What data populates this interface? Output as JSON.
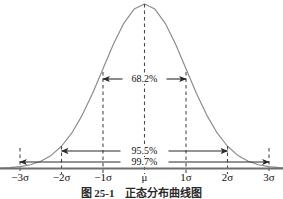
{
  "figure": {
    "caption": "图 25-1　正态分布曲线图",
    "background_color": "#ffffff"
  },
  "colors": {
    "curve": "#8a8a8a",
    "axis": "#6e6e6e",
    "dashed": "#4a4a4a",
    "arrow": "#2b2b2b",
    "text": "#111111"
  },
  "chart_data": {
    "type": "line",
    "title": "图 25-1　正态分布曲线图",
    "xlabel": "",
    "ylabel": "",
    "grid": false,
    "legend": "none",
    "xlim": [
      -3.55,
      3.05
    ],
    "ylim": [
      0,
      1.06
    ],
    "distribution": "standard normal (Gaussian) probability density",
    "mean_label": "μ",
    "categories": [
      "-3σ",
      "-2σ",
      "-1σ",
      "μ",
      "1σ",
      "2σ",
      "3σ"
    ],
    "x_tick_values": [
      -3,
      -2,
      -1,
      0,
      1,
      2,
      3
    ],
    "x_tick_labels": [
      "−3σ",
      "−2σ",
      "−1σ",
      "μ",
      "1σ",
      "2σ",
      "3σ"
    ],
    "x_tick_px": [
      20,
      61.5,
      103,
      144.5,
      186,
      227.5,
      269
    ],
    "curve_points_x": [
      -3.5,
      -3.25,
      -3,
      -2.75,
      -2.5,
      -2.25,
      -2,
      -1.75,
      -1.5,
      -1.25,
      -1,
      -0.75,
      -0.5,
      -0.25,
      0,
      0.25,
      0.5,
      0.75,
      1,
      1.25,
      1.5,
      1.75,
      2,
      2.25,
      2.5,
      2.75,
      3,
      3.25,
      3.5
    ],
    "curve_points_y": [
      0.0022,
      0.0051,
      0.0111,
      0.0228,
      0.0439,
      0.0796,
      0.1353,
      0.2163,
      0.3247,
      0.4578,
      0.6065,
      0.7548,
      0.8825,
      0.9692,
      1.0,
      0.9692,
      0.8825,
      0.7548,
      0.6065,
      0.4578,
      0.3247,
      0.2163,
      0.1353,
      0.0796,
      0.0439,
      0.0228,
      0.0111,
      0.0051,
      0.0022
    ],
    "intervals": [
      {
        "id": "one-sigma",
        "label": "68.2%",
        "from": -1,
        "to": 1,
        "row_px_y": 79,
        "label_px_x": 144.5
      },
      {
        "id": "two-sigma",
        "label": "95.5%",
        "from": -2,
        "to": 2,
        "row_px_y": 151,
        "label_px_x": 144.5
      },
      {
        "id": "three-sigma",
        "label": "99.7%",
        "from": -3,
        "to": 3,
        "row_px_y": 162,
        "label_px_x": 144.5
      }
    ],
    "dashed_verticals": [
      {
        "id": "neg-3-sigma",
        "x": -3,
        "px_x": 20,
        "top_px": 148,
        "bottom_px": 174
      },
      {
        "id": "neg-2-sigma",
        "x": -2,
        "px_x": 61.5,
        "top_px": 146,
        "bottom_px": 174
      },
      {
        "id": "neg-1-sigma",
        "x": -1,
        "px_x": 103,
        "top_px": 72,
        "bottom_px": 174
      },
      {
        "id": "mean",
        "x": 0,
        "px_x": 144.5,
        "top_px": 4,
        "bottom_px": 174
      },
      {
        "id": "pos-1-sigma",
        "x": 1,
        "px_x": 186,
        "top_px": 72,
        "bottom_px": 174
      },
      {
        "id": "pos-2-sigma",
        "x": 2,
        "px_x": 227.5,
        "top_px": 146,
        "bottom_px": 174
      },
      {
        "id": "pos-3-sigma",
        "x": 3,
        "px_x": 269,
        "top_px": 148,
        "bottom_px": 174
      }
    ],
    "baseline_px_y": 168.5
  }
}
